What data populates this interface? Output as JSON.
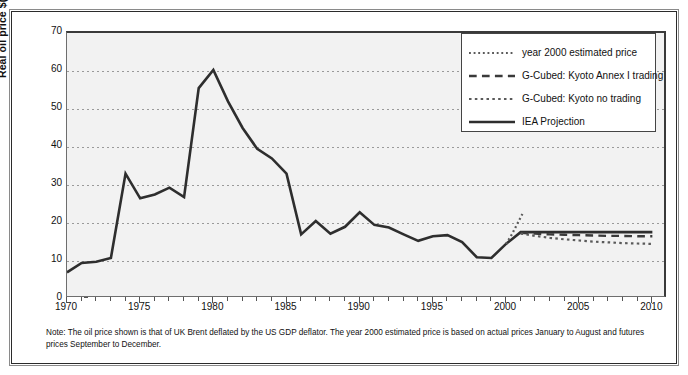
{
  "chart_data": {
    "type": "line",
    "title": "",
    "xlabel": "",
    "ylabel": "Real oil price $(1990) per barrel",
    "xlim": [
      1970,
      2011
    ],
    "ylim": [
      0,
      70
    ],
    "yticks": [
      0,
      10,
      20,
      30,
      40,
      50,
      60,
      70
    ],
    "xticks": [
      1970,
      1975,
      1980,
      1985,
      1990,
      1995,
      2000,
      2005,
      2010
    ],
    "xtick_labels": [
      "1970",
      "1975",
      "1980",
      "1985",
      "1990",
      "1995",
      "2000",
      "2005",
      "2010"
    ],
    "ytick_labels": [
      "0",
      "10",
      "20",
      "30",
      "40",
      "50",
      "60",
      "70"
    ],
    "grid": "horizontal dotted",
    "legend_position": "top-right inside plot",
    "series": [
      {
        "name": "IEA Projection",
        "style": "solid",
        "color": "#2e2e2e",
        "width": 2.6,
        "x": [
          1970,
          1971,
          1972,
          1973,
          1974,
          1975,
          1976,
          1977,
          1978,
          1979,
          1980,
          1981,
          1982,
          1983,
          1984,
          1985,
          1986,
          1987,
          1988,
          1989,
          1990,
          1991,
          1992,
          1993,
          1994,
          1995,
          1996,
          1997,
          1998,
          1999,
          2000,
          2001,
          2002,
          2003,
          2004,
          2005,
          2006,
          2007,
          2008,
          2009,
          2010
        ],
        "y": [
          7.0,
          9.5,
          9.8,
          10.8,
          33.0,
          26.5,
          27.5,
          29.3,
          26.8,
          55.5,
          60.3,
          52.0,
          45.0,
          39.5,
          37.0,
          33.0,
          17.0,
          20.5,
          17.2,
          19.0,
          22.8,
          19.5,
          18.8,
          17.0,
          15.3,
          16.5,
          16.8,
          15.0,
          11.0,
          10.8,
          14.5,
          17.6,
          17.6,
          17.6,
          17.6,
          17.6,
          17.6,
          17.6,
          17.6,
          17.6,
          17.6
        ]
      },
      {
        "name": "year 2000 estimated price",
        "style": "fine-dotted",
        "color": "#5a5a5a",
        "width": 2.2,
        "x": [
          2000,
          2000.4,
          2000.8,
          2001.2
        ],
        "y": [
          14.5,
          17.0,
          20.0,
          23.0
        ]
      },
      {
        "name": "G-Cubed: Kyoto Annex I trading",
        "style": "dashed",
        "color": "#3a3a3a",
        "width": 2.4,
        "x": [
          2001,
          2002,
          2003,
          2004,
          2005,
          2006,
          2007,
          2008,
          2009,
          2010
        ],
        "y": [
          17.4,
          17.2,
          17.0,
          16.9,
          16.8,
          16.7,
          16.6,
          16.6,
          16.5,
          16.5
        ]
      },
      {
        "name": "G-Cubed: Kyoto no trading",
        "style": "dotted",
        "color": "#5a5a5a",
        "width": 2.2,
        "x": [
          2001,
          2002,
          2003,
          2004,
          2005,
          2006,
          2007,
          2008,
          2009,
          2010
        ],
        "y": [
          17.2,
          16.6,
          16.1,
          15.7,
          15.4,
          15.1,
          14.9,
          14.7,
          14.6,
          14.5
        ]
      }
    ],
    "legend": [
      {
        "label": "year 2000 estimated price",
        "style": "fine-dotted"
      },
      {
        "label": "G-Cubed: Kyoto Annex I trading",
        "style": "dashed"
      },
      {
        "label": "G-Cubed: Kyoto no trading",
        "style": "dotted"
      },
      {
        "label": "IEA Projection",
        "style": "solid"
      }
    ],
    "note": "Note: The oil price shown is that of UK Brent deflated by the US GDP deflator. The year 2000 estimated price is based on actual prices January to August and futures prices September to December.",
    "colors": {
      "plot_background": "#f2f2f2",
      "axis": "#3a3a3a",
      "grid": "#9a9a9a",
      "line_primary": "#2e2e2e",
      "frame": "#2b2b2b"
    }
  }
}
